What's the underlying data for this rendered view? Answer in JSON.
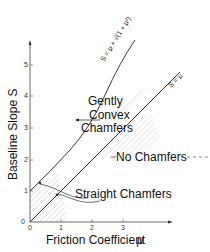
{
  "diagram": {
    "x_axis": {
      "label": "Friction Coefficient",
      "symbol": "μ",
      "ticks": [
        "0",
        "1",
        "2",
        "3"
      ]
    },
    "y_axis": {
      "label": "Baseline Slope S",
      "ticks": [
        "0",
        "1",
        "2",
        "3",
        "4",
        "5"
      ]
    },
    "curves": [
      {
        "name": "upper-boundary",
        "equation": "S = μ + √(1 + μ²)"
      },
      {
        "name": "lower-boundary",
        "equation": "S = μ"
      }
    ],
    "regions": [
      {
        "name": "gently-convex-chamfers",
        "lines": [
          "Gently",
          "Convex",
          "Chamfers"
        ]
      },
      {
        "name": "no-chamfers",
        "label": "No Chamfers"
      },
      {
        "name": "straight-chamfers",
        "label": "Straight Chamfers"
      }
    ],
    "colors": {
      "line": "#222222",
      "hatch": "#9a9a9a"
    }
  }
}
